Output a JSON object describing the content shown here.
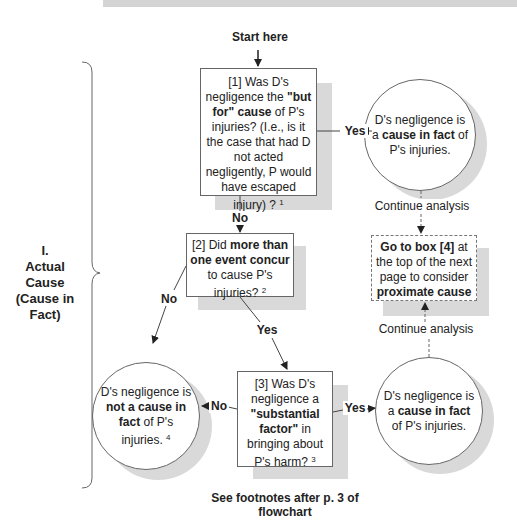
{
  "start": {
    "label": "Start here"
  },
  "section": {
    "number": "I.",
    "title_line1": "Actual",
    "title_line2": "Cause",
    "title_line3": "(Cause in",
    "title_line4": "Fact)"
  },
  "box1": {
    "prefix": "[1] Was D's negligence the ",
    "bold1": "\"but for\" cause",
    "mid": " of P's injuries? (I.e., is it the case that had D not acted negligently, P would have escaped injury) ? ",
    "footnote": "1"
  },
  "box2": {
    "prefix": "[2] Did ",
    "bold1": "more than one event concur",
    "mid": " to cause P's injuries? ",
    "footnote": "2"
  },
  "box3": {
    "prefix": "[3] Was D's negligence a ",
    "bold1": "\"substantial factor\"",
    "mid": " in bringing about P's harm? ",
    "footnote": "3"
  },
  "box4": {
    "bold1": "Go to box [4]",
    "mid": " at the top of the next page to consider ",
    "bold2": "proximate cause"
  },
  "circle_top_right": {
    "prefix": "D's negligence is a ",
    "bold": "cause in fact",
    "suffix": " of P's injuries."
  },
  "circle_bottom_right": {
    "prefix": "D's negligence is a ",
    "bold": "cause in fact",
    "suffix": " of P's injuries."
  },
  "circle_bottom_left": {
    "prefix": "D's negligence is ",
    "bold": "not a cause in fact",
    "suffix": " of P's injuries. ",
    "footnote": "4"
  },
  "edges": {
    "box1_yes": "Yes",
    "box1_no": "No",
    "box2_no": "No",
    "box2_yes": "Yes",
    "box3_no": "No",
    "box3_yes": "Yes",
    "continue_top": "Continue analysis",
    "continue_bottom": "Continue analysis"
  },
  "footer": {
    "line1": "See footnotes after p. 3 of",
    "line2": "flowchart"
  },
  "colors": {
    "line": "#444444",
    "shadow": "#d9d9d9",
    "border": "#666666"
  }
}
